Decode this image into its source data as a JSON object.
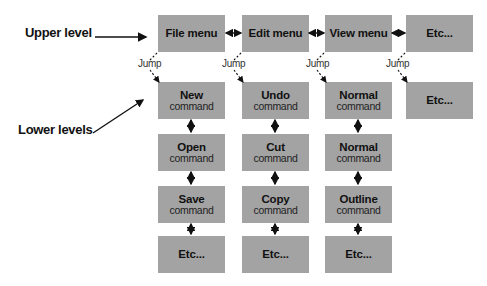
{
  "labels": {
    "upper": "Upper level",
    "lower": "Lower levels"
  },
  "jump_label": "Jump",
  "columns": [
    {
      "menu": "File menu",
      "items": [
        {
          "title": "New",
          "sub": "command"
        },
        {
          "title": "Open",
          "sub": "command"
        },
        {
          "title": "Save",
          "sub": "command"
        },
        {
          "title": "Etc...",
          "sub": ""
        }
      ]
    },
    {
      "menu": "Edit menu",
      "items": [
        {
          "title": "Undo",
          "sub": "command"
        },
        {
          "title": "Cut",
          "sub": "command"
        },
        {
          "title": "Copy",
          "sub": "command"
        },
        {
          "title": "Etc...",
          "sub": ""
        }
      ]
    },
    {
      "menu": "View menu",
      "items": [
        {
          "title": "Normal",
          "sub": "command"
        },
        {
          "title": "Normal",
          "sub": "command"
        },
        {
          "title": "Outline",
          "sub": "command"
        },
        {
          "title": "Etc...",
          "sub": ""
        }
      ]
    },
    {
      "menu": "Etc...",
      "items": [
        {
          "title": "Etc...",
          "sub": ""
        }
      ]
    }
  ],
  "colors": {
    "box": "#a3a3a3",
    "arrow": "#111111"
  }
}
